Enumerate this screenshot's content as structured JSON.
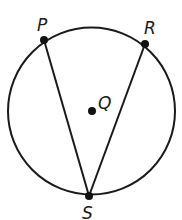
{
  "diagram": {
    "type": "circle-geometry",
    "circle": {
      "center_label": "Q",
      "stroke": "#1a1a1a"
    },
    "points": [
      {
        "id": "P",
        "label": "P"
      },
      {
        "id": "R",
        "label": "R"
      },
      {
        "id": "Q",
        "label": "Q"
      },
      {
        "id": "S",
        "label": "S"
      }
    ],
    "segments": [
      {
        "from": "P",
        "to": "S"
      },
      {
        "from": "R",
        "to": "S"
      }
    ]
  }
}
